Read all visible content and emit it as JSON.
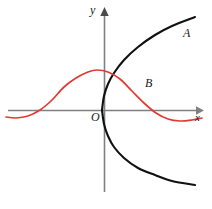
{
  "figure": {
    "title": "",
    "background_color": "#ffffff",
    "width": 212,
    "height": 209
  },
  "axes": {
    "color": "#808080",
    "x_axis": {
      "label": "x",
      "y_pixel": 110,
      "x_start": 8,
      "x_end": 202,
      "arrow": "right"
    },
    "y_axis": {
      "label": "y",
      "x_pixel": 104,
      "y_start": 192,
      "y_end": 8,
      "arrow": "up"
    },
    "origin_label": "O"
  },
  "curves": [
    {
      "name": "A",
      "label": "A",
      "color": "#111111",
      "stroke_width": 2.1,
      "description": "sideways parabola opening right, vertex at origin"
    },
    {
      "name": "B",
      "label": "B",
      "color": "#e03a34",
      "stroke_width": 1.6,
      "description": "wave curve rising from left to a maximum then falling and levelling"
    }
  ],
  "chart_data": {
    "type": "line",
    "title": "",
    "xlabel": "x",
    "ylabel": "y",
    "grid": false,
    "legend": "inline-labels",
    "xlim": [
      -3.2,
      3.2
    ],
    "ylim": [
      -3.3,
      3.3
    ],
    "series": [
      {
        "name": "A",
        "label": "A",
        "color": "#111111",
        "kind": "parabola-sideways-upper",
        "points_px": [
          [
            102,
            110
          ],
          [
            104,
            96
          ],
          [
            108,
            84
          ],
          [
            114,
            73
          ],
          [
            124,
            60
          ],
          [
            138,
            47
          ],
          [
            155,
            35
          ],
          [
            172,
            26
          ],
          [
            195,
            17
          ]
        ]
      },
      {
        "name": "A",
        "label": "A",
        "color": "#111111",
        "kind": "parabola-sideways-lower",
        "points_px": [
          [
            102,
            110
          ],
          [
            104,
            124
          ],
          [
            108,
            136
          ],
          [
            114,
            147
          ],
          [
            124,
            158
          ],
          [
            138,
            168
          ],
          [
            155,
            175
          ],
          [
            172,
            181
          ],
          [
            195,
            185
          ]
        ]
      },
      {
        "name": "B",
        "label": "B",
        "color": "#e03a34",
        "kind": "wave",
        "points_px": [
          [
            6,
            117
          ],
          [
            16,
            118
          ],
          [
            28,
            116
          ],
          [
            40,
            110
          ],
          [
            52,
            100
          ],
          [
            64,
            87
          ],
          [
            76,
            78
          ],
          [
            88,
            72
          ],
          [
            97,
            70
          ],
          [
            108,
            72
          ],
          [
            120,
            79
          ],
          [
            132,
            91
          ],
          [
            144,
            103
          ],
          [
            156,
            113
          ],
          [
            168,
            119
          ],
          [
            180,
            121
          ],
          [
            192,
            120
          ],
          [
            202,
            118
          ]
        ]
      }
    ],
    "annotations": [
      {
        "text": "A",
        "x_px": 186,
        "y_px": 34
      },
      {
        "text": "B",
        "x_px": 148,
        "y_px": 85
      },
      {
        "text": "O",
        "x_px": 94,
        "y_px": 118
      },
      {
        "text": "y",
        "x_px": 93,
        "y_px": 11
      },
      {
        "text": "x",
        "x_px": 198,
        "y_px": 118
      }
    ]
  }
}
